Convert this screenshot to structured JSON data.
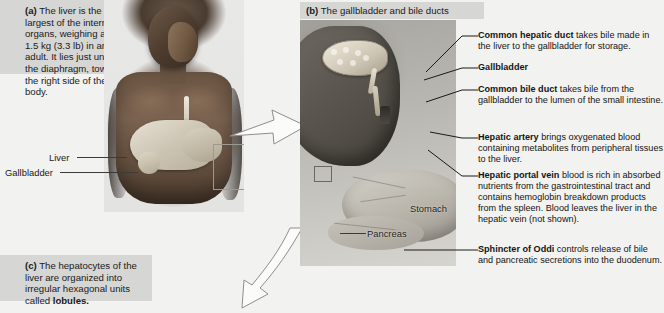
{
  "figure": {
    "panel_a": {
      "tag": "(a)",
      "text": "The liver is the largest of the internal organs, weighing about 1.5 kg (3.3 lb) in an adult. It lies just under the diaphragm, toward the right side of the body."
    },
    "panel_b": {
      "tag": "(b)",
      "title": "The gallbladder and bile ducts"
    },
    "panel_c": {
      "tag": "(c)",
      "text_before": "The hepatocytes of the liver are organized into irregular hexagonal units called ",
      "bold_term": "lobules."
    }
  },
  "photo_labels": [
    {
      "name": "liver-label",
      "text": "Liver"
    },
    {
      "name": "gallbladder-label",
      "text": "Gallbladder"
    }
  ],
  "illustration_labels": [
    {
      "name": "stomach-label",
      "text": "Stomach"
    },
    {
      "name": "pancreas-label",
      "text": "Pancreas"
    }
  ],
  "annotations": [
    {
      "term": "Common hepatic duct",
      "description": " takes bile made in the liver to the gallbladder for storage."
    },
    {
      "term": "Gallbladder",
      "description": ""
    },
    {
      "term": "Common bile duct",
      "description": " takes bile from the gallbladder to the lumen of the small intestine."
    },
    {
      "term": "Hepatic artery",
      "description": " brings oxygenated blood containing metabolites from peripheral tissues to the liver."
    },
    {
      "term": "Hepatic portal vein",
      "description": " blood is rich in absorbed nutrients from the gastrointestinal tract and contains hemoglobin breakdown products from the spleen. Blood leaves the liver in the hepatic vein (not shown)."
    },
    {
      "term": "Sphincter of Oddi",
      "description": " controls release of bile and pancreatic secretions into the duodenum."
    }
  ],
  "colors": {
    "page_background": "#f2f2f0",
    "caption_background": "#d6d6d4",
    "text": "#1a1a1a",
    "leader_line": "#1a1a1a"
  }
}
